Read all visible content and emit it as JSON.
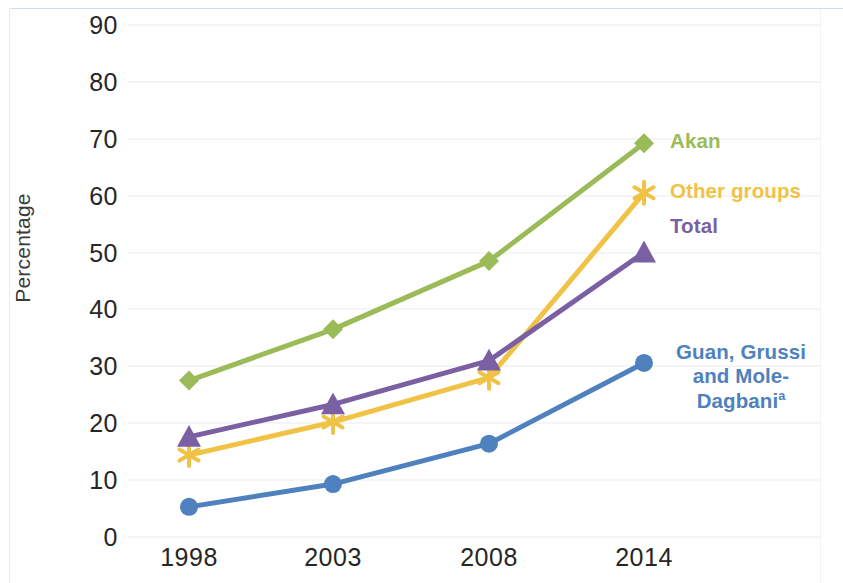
{
  "chart_data": {
    "type": "line",
    "title": "",
    "xlabel": "",
    "ylabel": "Percentage",
    "categories": [
      "1998",
      "2003",
      "2008",
      "2014"
    ],
    "x": [
      1998,
      2003,
      2008,
      2014
    ],
    "ylim": [
      0,
      90
    ],
    "ytick_labels": [
      "0",
      "10",
      "20",
      "30",
      "40",
      "50",
      "60",
      "70",
      "80",
      "90"
    ],
    "ytick_values": [
      0,
      10,
      20,
      30,
      40,
      50,
      60,
      70,
      80,
      90
    ],
    "grid": true,
    "legend_position": "right-inline-labels",
    "series": [
      {
        "name": "Akan",
        "label": "Akan",
        "color": "#9bbb59",
        "marker": "diamond",
        "values": [
          27.5,
          36.5,
          48.5,
          69.2
        ]
      },
      {
        "name": "Other groups",
        "label": "Other groups",
        "color": "#f0c246",
        "marker": "asterisk",
        "values": [
          14.4,
          20.2,
          28.0,
          60.5
        ]
      },
      {
        "name": "Total",
        "label": "Total",
        "color": "#7b5fa3",
        "marker": "triangle",
        "values": [
          17.6,
          23.3,
          31.0,
          50.0
        ]
      },
      {
        "name": "Guan, Grussi and Mole-Dagbani",
        "label_line_1": "Guan, Grussi",
        "label_line_2": "and Mole-",
        "label_line_3": "Dagbani",
        "label_superscript": "a",
        "color": "#4e81bd",
        "marker": "circle",
        "values": [
          5.3,
          9.3,
          16.4,
          30.6
        ]
      }
    ]
  }
}
